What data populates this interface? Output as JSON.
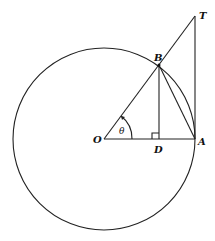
{
  "figure": {
    "labels": {
      "O": "O",
      "A": "A",
      "B": "B",
      "D": "D",
      "T": "T",
      "angle": "θ"
    },
    "angle_theta_deg": 53.4,
    "elements": [
      "circle centered at O",
      "segment OA",
      "segment OT through B",
      "tangent AT",
      "perpendicular BD with right-angle mark",
      "chord BA",
      "angle arc theta at O"
    ]
  }
}
